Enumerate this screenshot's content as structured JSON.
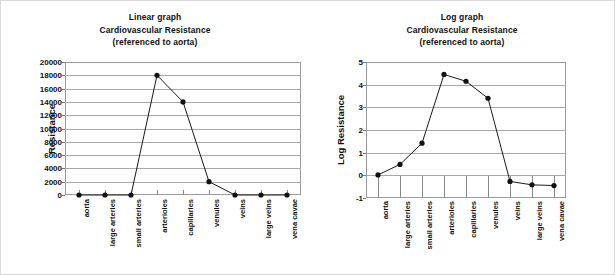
{
  "figure": {
    "background_color": "#ffffff",
    "line_color": "#111111",
    "grid_color": "#a8a8a8"
  },
  "charts": [
    {
      "id": "linear",
      "title_lines": [
        "Linear graph",
        "Cardiovascular Resistance",
        "(referenced to aorta)"
      ],
      "ylabel": "Resistance",
      "yticks": [
        "20000",
        "18000",
        "16000",
        "14000",
        "12000",
        "10000",
        "8000",
        "6000",
        "4000",
        "2000",
        "0"
      ],
      "xlabels": [
        "aorta",
        "large arteries",
        "small arteries",
        "arterioles",
        "capillaries",
        "venules",
        "veins",
        "large veins",
        "vena cavae"
      ]
    },
    {
      "id": "log",
      "title_lines": [
        "Log graph",
        "Cardiovascular Resistance",
        "(referenced to aorta)"
      ],
      "ylabel": "Log Resistance",
      "yticks": [
        "5",
        "4",
        "3",
        "2",
        "1",
        "0",
        "-1"
      ],
      "xlabels": [
        "aorta",
        "large arteries",
        "small arteries",
        "arterioles",
        "capillaries",
        "venules",
        "veins",
        "large veins",
        "vena cavae"
      ]
    }
  ],
  "chart_data": [
    {
      "type": "line",
      "title": "Linear graph / Cardiovascular Resistance (referenced to aorta)",
      "xlabel": "",
      "ylabel": "Resistance",
      "categories": [
        "aorta",
        "large arteries",
        "small arteries",
        "arterioles",
        "capillaries",
        "venules",
        "veins",
        "large veins",
        "vena cavae"
      ],
      "values": [
        0,
        0,
        0,
        18000,
        14000,
        2000,
        0,
        0,
        0
      ],
      "ylim": [
        0,
        20000
      ],
      "ytick_values": [
        0,
        2000,
        4000,
        6000,
        8000,
        10000,
        12000,
        14000,
        16000,
        18000,
        20000
      ],
      "grid": "horizontal",
      "legend": "none",
      "marker": "filled-circle"
    },
    {
      "type": "line",
      "title": "Log graph / Cardiovascular Resistance (referenced to aorta)",
      "xlabel": "",
      "ylabel": "Log Resistance",
      "categories": [
        "aorta",
        "large arteries",
        "small arteries",
        "arterioles",
        "capillaries",
        "venules",
        "veins",
        "large veins",
        "vena cavae"
      ],
      "values": [
        0.02,
        0.48,
        1.42,
        4.45,
        4.15,
        3.4,
        -0.27,
        -0.42,
        -0.45
      ],
      "ylim": [
        -1,
        5
      ],
      "ytick_values": [
        -1,
        0,
        1,
        2,
        3,
        4,
        5
      ],
      "grid": "horizontal",
      "legend": "none",
      "marker": "filled-circle"
    }
  ]
}
